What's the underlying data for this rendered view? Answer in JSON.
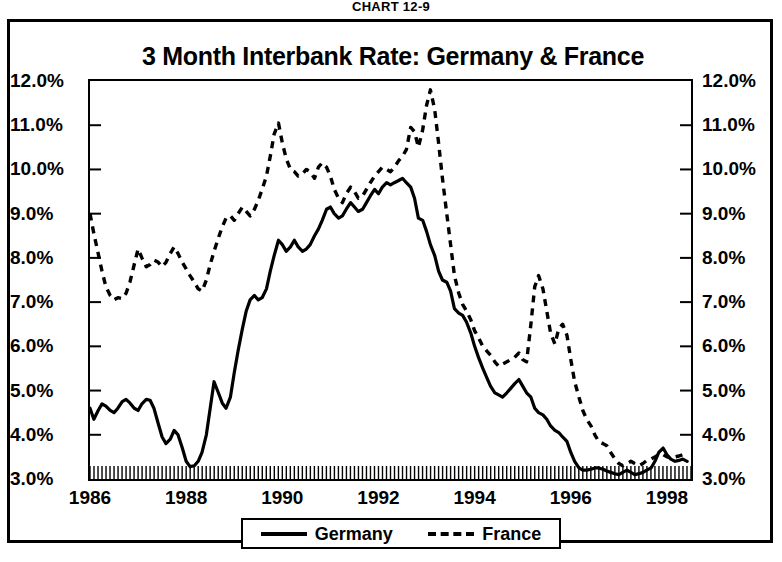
{
  "figure": {
    "chart_number": "CHART 12-9"
  },
  "legend": {
    "position": "below-plot",
    "entries": [
      {
        "label": "Germany",
        "style": "solid",
        "icon": "solid-line-swatch"
      },
      {
        "label": "France",
        "style": "dashed",
        "icon": "dashed-line-swatch"
      }
    ]
  },
  "chart_data": {
    "type": "line",
    "title": "3 Month Interbank Rate: Germany & France",
    "xlabel": "",
    "ylabel": "",
    "grid": false,
    "xlim": [
      1986.0,
      1998.5
    ],
    "ylim": [
      3.0,
      12.0
    ],
    "ytick_labels": [
      "12.0%",
      "11.0%",
      "10.0%",
      "9.0%",
      "8.0%",
      "7.0%",
      "6.0%",
      "5.0%",
      "4.0%",
      "3.0%"
    ],
    "ytick_values": [
      12.0,
      11.0,
      10.0,
      9.0,
      8.0,
      7.0,
      6.0,
      5.0,
      4.0,
      3.0
    ],
    "ytick_side": "both",
    "xtick_labels": [
      "1986",
      "1988",
      "1990",
      "1992",
      "1994",
      "1996",
      "1998"
    ],
    "xtick_values": [
      1986,
      1988,
      1990,
      1992,
      1994,
      1996,
      1998
    ],
    "minor_xticks": "monthly",
    "series": [
      {
        "name": "Germany",
        "style": "solid",
        "x": [
          1986.0,
          1986.08,
          1986.17,
          1986.25,
          1986.33,
          1986.42,
          1986.5,
          1986.58,
          1986.67,
          1986.75,
          1986.83,
          1986.92,
          1987.0,
          1987.08,
          1987.17,
          1987.25,
          1987.33,
          1987.42,
          1987.5,
          1987.58,
          1987.67,
          1987.75,
          1987.83,
          1987.92,
          1988.0,
          1988.08,
          1988.17,
          1988.25,
          1988.33,
          1988.42,
          1988.5,
          1988.58,
          1988.67,
          1988.75,
          1988.83,
          1988.92,
          1989.0,
          1989.08,
          1989.17,
          1989.25,
          1989.33,
          1989.42,
          1989.5,
          1989.58,
          1989.67,
          1989.75,
          1989.83,
          1989.92,
          1990.0,
          1990.08,
          1990.17,
          1990.25,
          1990.33,
          1990.42,
          1990.5,
          1990.58,
          1990.67,
          1990.75,
          1990.83,
          1990.92,
          1991.0,
          1991.08,
          1991.17,
          1991.25,
          1991.33,
          1991.42,
          1991.5,
          1991.58,
          1991.67,
          1991.75,
          1991.83,
          1991.92,
          1992.0,
          1992.08,
          1992.17,
          1992.25,
          1992.33,
          1992.42,
          1992.5,
          1992.58,
          1992.67,
          1992.75,
          1992.83,
          1992.92,
          1993.0,
          1993.08,
          1993.17,
          1993.25,
          1993.33,
          1993.42,
          1993.5,
          1993.58,
          1993.67,
          1993.75,
          1993.83,
          1993.92,
          1994.0,
          1994.08,
          1994.17,
          1994.25,
          1994.33,
          1994.42,
          1994.5,
          1994.58,
          1994.67,
          1994.75,
          1994.83,
          1994.92,
          1995.0,
          1995.08,
          1995.17,
          1995.25,
          1995.33,
          1995.42,
          1995.5,
          1995.58,
          1995.67,
          1995.75,
          1995.83,
          1995.92,
          1996.0,
          1996.08,
          1996.17,
          1996.25,
          1996.33,
          1996.42,
          1996.5,
          1996.58,
          1996.67,
          1996.75,
          1996.83,
          1996.92,
          1997.0,
          1997.08,
          1997.17,
          1997.25,
          1997.33,
          1997.42,
          1997.5,
          1997.58,
          1997.67,
          1997.75,
          1997.83,
          1997.92,
          1998.0,
          1998.08,
          1998.17,
          1998.25,
          1998.33,
          1998.42
        ],
        "y": [
          4.6,
          4.35,
          4.55,
          4.7,
          4.65,
          4.55,
          4.5,
          4.6,
          4.75,
          4.8,
          4.72,
          4.6,
          4.55,
          4.7,
          4.8,
          4.78,
          4.6,
          4.25,
          3.95,
          3.8,
          3.9,
          4.1,
          4.0,
          3.7,
          3.4,
          3.28,
          3.3,
          3.4,
          3.6,
          4.0,
          4.6,
          5.2,
          4.95,
          4.72,
          4.6,
          4.85,
          5.4,
          5.9,
          6.4,
          6.8,
          7.05,
          7.15,
          7.05,
          7.1,
          7.3,
          7.7,
          8.05,
          8.4,
          8.3,
          8.15,
          8.25,
          8.4,
          8.25,
          8.15,
          8.2,
          8.3,
          8.5,
          8.65,
          8.85,
          9.1,
          9.15,
          9.0,
          8.9,
          8.95,
          9.1,
          9.25,
          9.15,
          9.05,
          9.1,
          9.25,
          9.4,
          9.55,
          9.45,
          9.6,
          9.7,
          9.65,
          9.7,
          9.75,
          9.8,
          9.7,
          9.6,
          9.35,
          8.9,
          8.85,
          8.6,
          8.3,
          8.05,
          7.7,
          7.5,
          7.45,
          7.25,
          6.85,
          6.75,
          6.7,
          6.55,
          6.3,
          6.0,
          5.75,
          5.5,
          5.3,
          5.1,
          4.95,
          4.9,
          4.85,
          4.95,
          5.05,
          5.15,
          5.25,
          5.1,
          4.95,
          4.85,
          4.6,
          4.5,
          4.45,
          4.35,
          4.2,
          4.1,
          4.05,
          3.95,
          3.85,
          3.6,
          3.4,
          3.25,
          3.2,
          3.2,
          3.22,
          3.25,
          3.25,
          3.22,
          3.18,
          3.15,
          3.12,
          3.1,
          3.15,
          3.2,
          3.15,
          3.1,
          3.12,
          3.15,
          3.2,
          3.25,
          3.4,
          3.6,
          3.7,
          3.55,
          3.45,
          3.4,
          3.42,
          3.45,
          3.4
        ]
      },
      {
        "name": "France",
        "style": "dashed",
        "x": [
          1986.0,
          1986.08,
          1986.17,
          1986.25,
          1986.33,
          1986.42,
          1986.5,
          1986.58,
          1986.67,
          1986.75,
          1986.83,
          1986.92,
          1987.0,
          1987.08,
          1987.17,
          1987.25,
          1987.33,
          1987.42,
          1987.5,
          1987.58,
          1987.67,
          1987.75,
          1987.83,
          1987.92,
          1988.0,
          1988.08,
          1988.17,
          1988.25,
          1988.33,
          1988.42,
          1988.5,
          1988.58,
          1988.67,
          1988.75,
          1988.83,
          1988.92,
          1989.0,
          1989.08,
          1989.17,
          1989.25,
          1989.33,
          1989.42,
          1989.5,
          1989.58,
          1989.67,
          1989.75,
          1989.83,
          1989.92,
          1990.0,
          1990.08,
          1990.17,
          1990.25,
          1990.33,
          1990.42,
          1990.5,
          1990.58,
          1990.67,
          1990.75,
          1990.83,
          1990.92,
          1991.0,
          1991.08,
          1991.17,
          1991.25,
          1991.33,
          1991.42,
          1991.5,
          1991.58,
          1991.67,
          1991.75,
          1991.83,
          1991.92,
          1992.0,
          1992.08,
          1992.17,
          1992.25,
          1992.33,
          1992.42,
          1992.5,
          1992.58,
          1992.67,
          1992.75,
          1992.83,
          1992.92,
          1993.0,
          1993.08,
          1993.17,
          1993.25,
          1993.33,
          1993.42,
          1993.5,
          1993.58,
          1993.67,
          1993.75,
          1993.83,
          1993.92,
          1994.0,
          1994.08,
          1994.17,
          1994.25,
          1994.33,
          1994.42,
          1994.5,
          1994.58,
          1994.67,
          1994.75,
          1994.83,
          1994.92,
          1995.0,
          1995.08,
          1995.17,
          1995.25,
          1995.33,
          1995.42,
          1995.5,
          1995.58,
          1995.67,
          1995.75,
          1995.83,
          1995.92,
          1996.0,
          1996.08,
          1996.17,
          1996.25,
          1996.33,
          1996.42,
          1996.5,
          1996.58,
          1996.67,
          1996.75,
          1996.83,
          1996.92,
          1997.0,
          1997.08,
          1997.17,
          1997.25,
          1997.33,
          1997.42,
          1997.5,
          1997.58,
          1997.67,
          1997.75,
          1997.83,
          1997.92,
          1998.0,
          1998.08,
          1998.17,
          1998.25,
          1998.33,
          1998.42
        ],
        "y": [
          9.0,
          8.55,
          8.1,
          7.7,
          7.35,
          7.15,
          7.05,
          7.1,
          7.08,
          7.2,
          7.45,
          7.85,
          8.2,
          8.0,
          7.8,
          7.85,
          7.95,
          7.9,
          7.8,
          7.9,
          8.1,
          8.25,
          8.1,
          7.9,
          7.75,
          7.6,
          7.45,
          7.3,
          7.25,
          7.5,
          7.85,
          8.15,
          8.45,
          8.7,
          8.9,
          8.95,
          8.85,
          9.0,
          9.15,
          9.05,
          8.95,
          9.1,
          9.3,
          9.55,
          9.85,
          10.3,
          10.8,
          11.05,
          10.6,
          10.25,
          10.0,
          9.95,
          9.85,
          9.9,
          10.0,
          9.95,
          9.8,
          10.05,
          10.15,
          10.05,
          9.85,
          9.55,
          9.35,
          9.25,
          9.45,
          9.6,
          9.5,
          9.35,
          9.4,
          9.55,
          9.7,
          9.85,
          9.95,
          10.05,
          10.0,
          9.95,
          10.05,
          10.2,
          10.3,
          10.45,
          10.95,
          10.85,
          10.5,
          10.9,
          11.45,
          11.8,
          11.35,
          10.6,
          9.8,
          9.0,
          8.3,
          7.6,
          7.2,
          6.95,
          6.8,
          6.6,
          6.35,
          6.2,
          6.0,
          5.9,
          5.8,
          5.65,
          5.55,
          5.6,
          5.65,
          5.7,
          5.75,
          5.85,
          5.7,
          5.65,
          6.5,
          7.35,
          7.6,
          7.3,
          6.8,
          6.3,
          6.05,
          6.4,
          6.5,
          6.25,
          5.7,
          5.2,
          4.85,
          4.55,
          4.35,
          4.2,
          4.0,
          3.85,
          3.8,
          3.75,
          3.6,
          3.45,
          3.35,
          3.3,
          3.35,
          3.4,
          3.35,
          3.3,
          3.35,
          3.42,
          3.45,
          3.5,
          3.55,
          3.55,
          3.5,
          3.48,
          3.5,
          3.52,
          3.55,
          3.55
        ]
      }
    ]
  }
}
